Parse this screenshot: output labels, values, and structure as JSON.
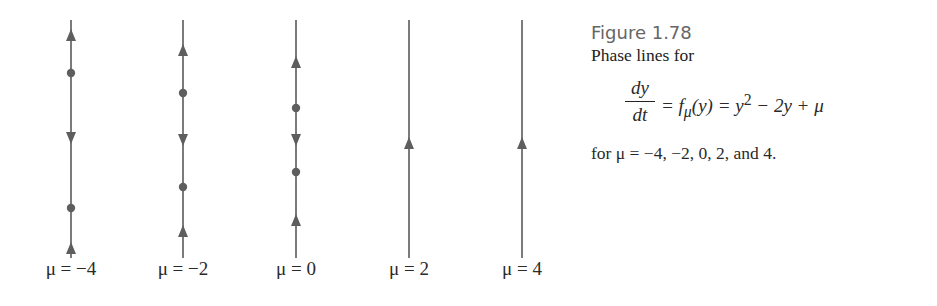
{
  "figure": {
    "number": "Figure 1.78",
    "caption_line1": "Phase lines for",
    "equation": {
      "numerator": "dy",
      "denominator": "dt",
      "rhs_part1": "= f",
      "rhs_sub": "μ",
      "rhs_part2": "(y) = y",
      "rhs_sup": "2",
      "rhs_part3": " − 2y + μ"
    },
    "caption_line2": "for μ = −4, −2, 0, 2, and 4."
  },
  "phase_lines": [
    {
      "mu_label": "μ = −4",
      "x": 71,
      "markers": [
        {
          "type": "arrow-up",
          "y": 35
        },
        {
          "type": "dot",
          "y": 73
        },
        {
          "type": "arrow-down",
          "y": 138
        },
        {
          "type": "dot",
          "y": 208
        },
        {
          "type": "arrow-up",
          "y": 248
        }
      ]
    },
    {
      "mu_label": "μ = −2",
      "x": 183,
      "markers": [
        {
          "type": "arrow-up",
          "y": 50
        },
        {
          "type": "dot",
          "y": 93
        },
        {
          "type": "arrow-down",
          "y": 140
        },
        {
          "type": "dot",
          "y": 187
        },
        {
          "type": "arrow-up",
          "y": 231
        }
      ]
    },
    {
      "mu_label": "μ = 0",
      "x": 296,
      "markers": [
        {
          "type": "arrow-up",
          "y": 62
        },
        {
          "type": "dot",
          "y": 108
        },
        {
          "type": "arrow-down",
          "y": 140
        },
        {
          "type": "dot",
          "y": 172
        },
        {
          "type": "arrow-up",
          "y": 220
        }
      ]
    },
    {
      "mu_label": "μ = 2",
      "x": 409,
      "markers": [
        {
          "type": "arrow-up",
          "y": 143
        }
      ]
    },
    {
      "mu_label": "μ = 4",
      "x": 522,
      "markers": [
        {
          "type": "arrow-up",
          "y": 143
        }
      ]
    }
  ],
  "colors": {
    "line": "#5a5a5a",
    "marker": "#5e5e5e"
  },
  "line_extent": {
    "top": 20,
    "bottom": 258
  }
}
